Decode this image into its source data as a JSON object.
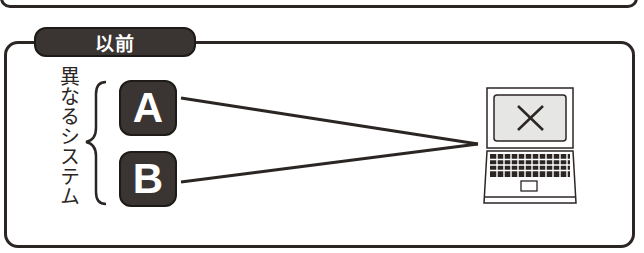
{
  "diagram": {
    "section_label": "以前",
    "group_label": "異なるシステム",
    "systems": [
      {
        "label": "A"
      },
      {
        "label": "B"
      }
    ],
    "target_device": "laptop-icon",
    "target_state": "x-mark",
    "colors": {
      "ink": "#2b2624",
      "box_fill": "#3a3532",
      "screen_fill": "#e6e6e4",
      "background": "#ffffff"
    }
  }
}
